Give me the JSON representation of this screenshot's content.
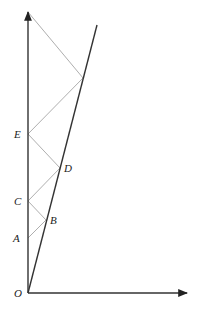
{
  "diagram": {
    "type": "geometry-reflection",
    "axes": {
      "origin": {
        "label": "O",
        "x": 28,
        "y": 293
      },
      "y_axis_top": {
        "x": 28,
        "y": 12
      },
      "x_axis_right": {
        "x": 187,
        "y": 293
      }
    },
    "slanted_line": {
      "from": {
        "x": 28,
        "y": 293
      },
      "to": {
        "x": 97,
        "y": 25
      }
    },
    "points": [
      {
        "label": "A",
        "x": 28,
        "y": 238,
        "on": "y-axis"
      },
      {
        "label": "B",
        "x": 46,
        "y": 220,
        "on": "slanted-line"
      },
      {
        "label": "C",
        "x": 28,
        "y": 201,
        "on": "y-axis"
      },
      {
        "label": "D",
        "x": 60,
        "y": 168,
        "on": "slanted-line"
      },
      {
        "label": "E",
        "x": 28,
        "y": 134,
        "on": "y-axis"
      }
    ],
    "zigzag_path": [
      {
        "x": 28,
        "y": 238
      },
      {
        "x": 46,
        "y": 220
      },
      {
        "x": 28,
        "y": 201
      },
      {
        "x": 60,
        "y": 168
      },
      {
        "x": 28,
        "y": 134
      },
      {
        "x": 83,
        "y": 78
      },
      {
        "x": 28,
        "y": 12
      }
    ],
    "labels": {
      "O": "O",
      "A": "A",
      "B": "B",
      "C": "C",
      "D": "D",
      "E": "E"
    },
    "colors": {
      "axis": "#333333",
      "slanted": "#333333",
      "zigzag": "#999999"
    }
  }
}
